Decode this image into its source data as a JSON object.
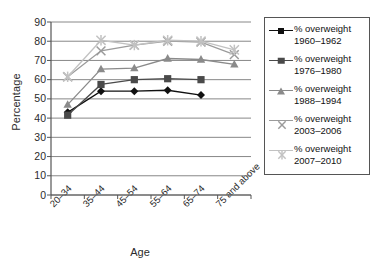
{
  "chart_data": {
    "type": "line",
    "title": "",
    "xlabel": "Age",
    "ylabel": "Percentage",
    "categories": [
      "20–34",
      "35–44",
      "45–54",
      "55–64",
      "65–74",
      "75 and above"
    ],
    "ylim": [
      0,
      90
    ],
    "yticks": [
      0,
      10,
      20,
      30,
      40,
      50,
      60,
      70,
      80,
      90
    ],
    "grid": true,
    "legend_position": "right",
    "series": [
      {
        "name": "% overweight 1960–1962",
        "label_line1": "% overweight",
        "label_line2": "1960–1962",
        "marker": "diamond",
        "color": "#101010",
        "values": [
          43,
          54,
          54,
          54.5,
          52,
          null
        ]
      },
      {
        "name": "% overweight 1976–1980",
        "label_line1": "% overweight",
        "label_line2": "1976–1980",
        "marker": "square",
        "color": "#4a4a4a",
        "values": [
          41.5,
          57.5,
          60,
          60.5,
          60,
          null
        ]
      },
      {
        "name": "% overweight 1988–1994",
        "label_line1": "% overweight",
        "label_line2": "1988–1994",
        "marker": "triangle",
        "color": "#8a8a8a",
        "values": [
          47,
          65.5,
          66,
          71,
          70.5,
          68
        ]
      },
      {
        "name": "% overweight 2003–2006",
        "label_line1": "% overweight",
        "label_line2": "2003–2006",
        "marker": "x",
        "color": "#9b9b9b",
        "values": [
          61.5,
          75,
          78,
          80,
          79.5,
          73
        ]
      },
      {
        "name": "% overweight 2007–2010",
        "label_line1": "% overweight",
        "label_line2": "2007–2010",
        "marker": "star",
        "color": "#c2c2c2",
        "values": [
          61.5,
          80.5,
          78,
          80.5,
          80,
          75.5
        ]
      }
    ]
  },
  "axis": {
    "y_title": "Percentage",
    "x_title": "Age"
  },
  "colors": {
    "axis_line": "#555555",
    "gridline": "#7a7a7a",
    "background": "#ffffff",
    "legend_border": "#555555"
  }
}
